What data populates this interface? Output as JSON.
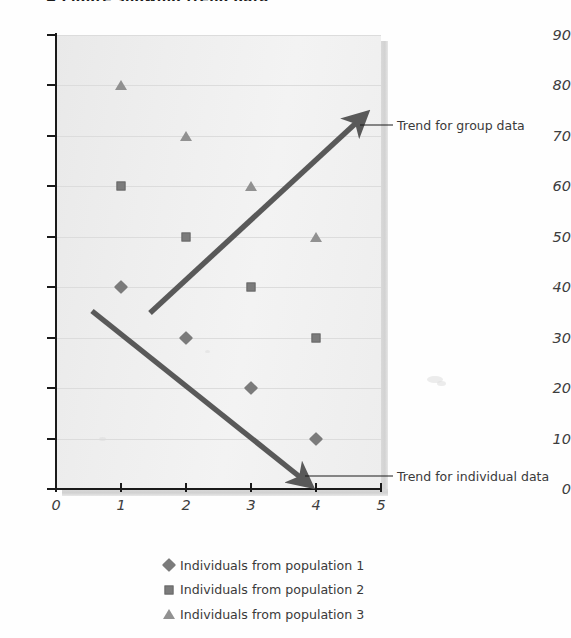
{
  "top_fragment": "A Figure showing trend data",
  "colors": {
    "marker": "#7b7b7b",
    "arrow": "#595959",
    "axis": "#1a1a1a",
    "gridline": "#dcdcdc",
    "plot_background": "#eeeeee",
    "text": "#3a3a3a"
  },
  "annotations": [
    {
      "name": "trend-group",
      "label": "Trend for group data"
    },
    {
      "name": "trend-individual",
      "label": "Trend for individual data"
    }
  ],
  "legend": {
    "items": [
      {
        "marker": "diamond-marker",
        "label": "Individuals from population 1"
      },
      {
        "marker": "square-marker",
        "label": "Individuals from population 2"
      },
      {
        "marker": "triangle-marker",
        "label": "Individuals from population 3"
      }
    ]
  },
  "chart_data": {
    "type": "scatter",
    "title": "",
    "xlabel": "",
    "ylabel": "",
    "xlim": [
      0,
      5
    ],
    "ylim": [
      0,
      90
    ],
    "xticks": [
      0,
      1,
      2,
      3,
      4,
      5
    ],
    "yticks": [
      0,
      10,
      20,
      30,
      40,
      50,
      60,
      70,
      80,
      90
    ],
    "grid": true,
    "legend_position": "bottom",
    "series": [
      {
        "name": "Individuals from population 1",
        "marker": "diamond",
        "color": "#7b7b7b",
        "x": [
          1,
          2,
          3,
          4
        ],
        "y": [
          40,
          30,
          20,
          10
        ]
      },
      {
        "name": "Individuals from population 2",
        "marker": "square",
        "color": "#7b7b7b",
        "x": [
          1,
          2,
          3,
          4
        ],
        "y": [
          60,
          50,
          40,
          30
        ]
      },
      {
        "name": "Individuals from population 3",
        "marker": "triangle",
        "color": "#8b8b8b",
        "x": [
          1,
          2,
          3,
          4
        ],
        "y": [
          80,
          70,
          60,
          50
        ]
      }
    ],
    "annotations": [
      {
        "text": "Trend for group data",
        "arrow_from": [
          0.62,
          33
        ],
        "arrow_to": [
          3.9,
          72
        ],
        "direction": "up"
      },
      {
        "text": "Trend for individual data",
        "arrow_from": [
          0.56,
          35
        ],
        "arrow_to": [
          3.84,
          1
        ],
        "direction": "down"
      }
    ]
  }
}
